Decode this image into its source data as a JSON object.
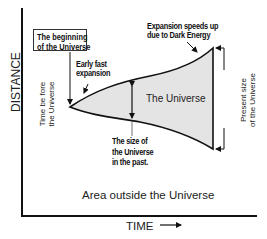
{
  "diagram": {
    "axes": {
      "y_label": "DISTANCE",
      "x_label": "TIME",
      "x_arrow_icon": "right-arrow"
    },
    "labels": {
      "beginning": [
        "The beginning",
        "of the Universe"
      ],
      "early_expansion": [
        "Early fast",
        "expansion"
      ],
      "dark_energy": [
        "Expansion speeds up",
        "due to Dark Energy"
      ],
      "time_before": [
        "Time be fore",
        "the Universe"
      ],
      "universe": "The Universe",
      "size_past": [
        "The size of",
        "the Universe",
        "in the past."
      ],
      "present_size": [
        "Present size",
        "of the Universe"
      ],
      "outside": "Area outside the Universe"
    },
    "colors": {
      "universe_fill": "#e4e4e4",
      "line": "#111111",
      "background": "#ffffff"
    }
  }
}
